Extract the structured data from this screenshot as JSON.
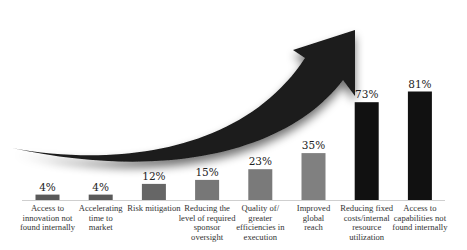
{
  "chart_data": {
    "type": "bar",
    "title": "",
    "xlabel": "",
    "ylabel": "",
    "ylim": [
      0,
      100
    ],
    "grid": false,
    "categories": [
      "Access to innovation not found internally",
      "Accelerating time to market",
      "Risk mitigation",
      "Reducing the level of required sponsor oversight",
      "Quality of/ greater efficiencies in execution",
      "Improved global reach",
      "Reducing fixed costs/internal resource utilization",
      "Access to capabilities not found internally"
    ],
    "category_lines": [
      [
        "Access to",
        "innovation not",
        "found internally"
      ],
      [
        "Accelerating",
        "time to",
        "market"
      ],
      [
        "Risk mitigation"
      ],
      [
        "Reducing the",
        "level of required",
        "sponsor",
        "oversight"
      ],
      [
        "Quality of/",
        "greater",
        "efficiencies in",
        "execution"
      ],
      [
        "Improved",
        "global",
        "reach"
      ],
      [
        "Reducing fixed",
        "costs/internal",
        "resource",
        "utilization"
      ],
      [
        "Access to",
        "capabilities not",
        "found internally"
      ]
    ],
    "values": [
      4,
      4,
      12,
      15,
      23,
      35,
      73,
      81
    ],
    "value_labels": [
      "4%",
      "4%",
      "12%",
      "15%",
      "23%",
      "35%",
      "73%",
      "81%"
    ],
    "bar_colors": [
      "#5a5a5a",
      "#5a5a5a",
      "#666666",
      "#777777",
      "#7a7a7a",
      "#808080",
      "#111111",
      "#111111"
    ],
    "annotations": [
      {
        "type": "curved-arrow",
        "text": "Outsourcing drivers",
        "color": "#1a1a1a"
      }
    ]
  }
}
